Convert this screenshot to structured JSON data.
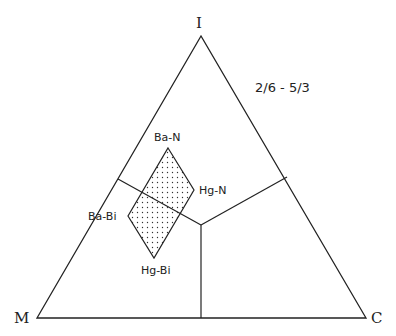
{
  "diagram": {
    "type": "ternary",
    "ratio_label": "2/6 - 5/3",
    "vertices": {
      "top": "I",
      "bottom_left": "M",
      "bottom_right": "C"
    },
    "field_labels": {
      "top": "Ba-N",
      "right": "Hg-N",
      "bottom": "Hg-Bi",
      "left": "Ba-Bi"
    },
    "colors": {
      "line": "#222222",
      "dots": "#333333",
      "background": "#ffffff"
    }
  }
}
